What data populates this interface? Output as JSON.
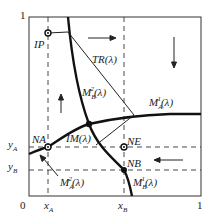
{
  "axes": {
    "x_ticks": {
      "zero": "0",
      "xA": "x",
      "xA_sub": "A",
      "xB": "x",
      "xB_sub": "B",
      "one": "1"
    },
    "y_ticks": {
      "one": "1",
      "yA": "y",
      "yA_sub": "A",
      "yB": "y",
      "yB_sub": "B"
    }
  },
  "labels": {
    "IP": "IP",
    "TR": "TR(λ)",
    "MB2": {
      "base": "M",
      "sup": "2",
      "sub": "B",
      "arg": "(λ)"
    },
    "MA1": {
      "base": "M",
      "sup": "1",
      "sub": "A",
      "arg": "(λ)"
    },
    "IM": "IM(λ)",
    "NA": "NA",
    "NE": "NE",
    "NB": "NB",
    "MA2": {
      "base": "M",
      "sup": "2",
      "sub": "A",
      "arg": "(λ)"
    },
    "MB1": {
      "base": "M",
      "sup": "1",
      "sub": "B",
      "arg": "(λ)"
    }
  },
  "colors": {
    "line": "#222222",
    "dash": "#333333",
    "background": "#ffffff"
  }
}
